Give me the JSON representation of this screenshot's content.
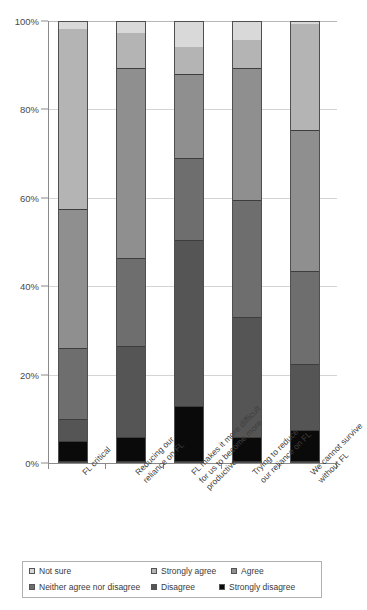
{
  "chart_data": {
    "type": "bar",
    "subtype": "stacked-percentage-column",
    "title": "",
    "xlabel": "",
    "ylabel": "",
    "ylim": [
      0,
      100
    ],
    "y_tick_labels": [
      "0%",
      "20%",
      "40%",
      "60%",
      "80%",
      "100%"
    ],
    "y_tick_values": [
      0,
      20,
      40,
      60,
      80,
      100
    ],
    "grid": true,
    "legend_position": "bottom",
    "categories": [
      "FL critical",
      "Reducing our reliance on FL",
      "FL makes it more difficult for us to become more productive",
      "Trying to reduce our reliance on FL",
      "We cannot survive without FL"
    ],
    "category_lines": [
      [
        "FL critical"
      ],
      [
        "Reducing our",
        "reliance on FL"
      ],
      [
        "FL makes it more difficult",
        "for us to become more",
        "productive"
      ],
      [
        "Trying to reduce",
        "our reliance on FL"
      ],
      [
        "We cannot survive",
        "without FL"
      ]
    ],
    "series": [
      {
        "name": "Strongly disagree",
        "color": "#0a0a0a",
        "values": [
          4.5,
          5.5,
          12.5,
          5.5,
          7.0
        ]
      },
      {
        "name": "Disagree",
        "color": "#555555",
        "values": [
          5.0,
          20.5,
          37.5,
          27.0,
          15.0
        ]
      },
      {
        "name": "Neither agree nor  disagree",
        "color": "#6e6e6e",
        "values": [
          16.0,
          20.0,
          18.5,
          26.5,
          21.0
        ]
      },
      {
        "name": "Agree",
        "color": "#8f8f8f",
        "values": [
          31.5,
          43.0,
          19.0,
          30.0,
          32.0
        ]
      },
      {
        "name": "Strongly agree",
        "color": "#b4b4b4",
        "values": [
          41.0,
          8.0,
          6.5,
          6.5,
          24.0
        ]
      },
      {
        "name": "Not sure",
        "color": "#d9d9d9",
        "values": [
          2.0,
          3.0,
          6.0,
          4.5,
          1.0
        ]
      }
    ],
    "stack_order_bottom_to_top": [
      "Strongly disagree",
      "Disagree",
      "Neither agree nor  disagree",
      "Agree",
      "Strongly agree",
      "Not sure"
    ]
  },
  "legend": {
    "items": [
      {
        "label": "Not sure",
        "color": "#d9d9d9"
      },
      {
        "label": "Strongly agree",
        "color": "#b4b4b4"
      },
      {
        "label": "Agree",
        "color": "#8f8f8f"
      },
      {
        "label": "Neither agree nor  disagree",
        "color": "#6e6e6e"
      },
      {
        "label": "Disagree",
        "color": "#555555"
      },
      {
        "label": "Strongly disagree",
        "color": "#0a0a0a"
      }
    ]
  },
  "colors": {
    "axis": "#8a8a8a",
    "grid": "#d4d4d4",
    "bar_outline": "#4f4f4f",
    "background": "#ffffff",
    "text": "#3a3a3a"
  }
}
